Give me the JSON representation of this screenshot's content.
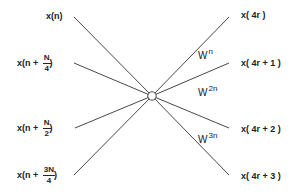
{
  "diagram": {
    "type": "radix-4 butterfly (decimation-in-frequency)",
    "node": {
      "x": 152,
      "y": 96,
      "r": 4
    },
    "inputs": [
      {
        "id": "in0",
        "prefix": "x(n)",
        "frac_num": "",
        "frac_den": "",
        "suffix": "",
        "y": 17
      },
      {
        "id": "in1",
        "prefix": "x(n +",
        "frac_num": "N",
        "frac_den": "4",
        "suffix": ")",
        "y": 63
      },
      {
        "id": "in2",
        "prefix": "x(n +",
        "frac_num": "N",
        "frac_den": "2",
        "suffix": ")",
        "y": 128
      },
      {
        "id": "in3",
        "prefix": "x(n +",
        "frac_num": "3N",
        "frac_den": "4",
        "suffix": ")",
        "y": 175
      }
    ],
    "outputs": [
      {
        "id": "out0",
        "label": "x( 4r )",
        "y": 17
      },
      {
        "id": "out1",
        "label": "x( 4r + 1 )",
        "y": 63
      },
      {
        "id": "out2",
        "label": "x( 4r + 2 )",
        "y": 128
      },
      {
        "id": "out3",
        "label": "x( 4r + 3 )",
        "y": 175
      }
    ],
    "twiddles": [
      {
        "base": "W",
        "exp": "n"
      },
      {
        "base": "W",
        "exp": "2n"
      },
      {
        "base": "W",
        "exp": "3n"
      }
    ],
    "colors": {
      "line": "#333333",
      "node_fill": "#ffffff",
      "text": "#222222"
    }
  }
}
